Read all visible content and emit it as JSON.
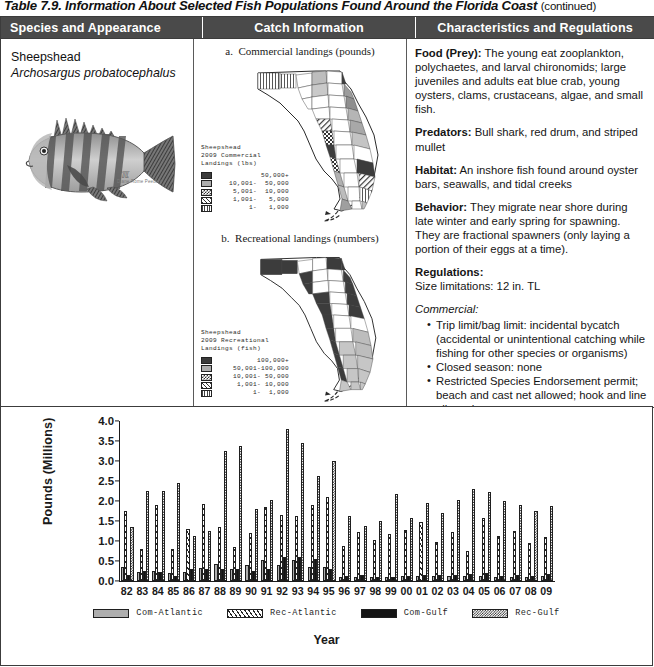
{
  "caption": {
    "text": "Table 7.9. Information About Selected Fish Populations Found Around the Florida Coast",
    "continued": "(continued)"
  },
  "table": {
    "headers": [
      "Species and Appearance",
      "Catch Information",
      "Characteristics and Regulations"
    ],
    "species": {
      "common_name": "Sheepshead",
      "scientific_name": "Archosargus probatocephalus",
      "illustration_credit": "Diane Rome Peebles",
      "illustration_alt": "sheepshead-fish-illustration"
    },
    "catch": {
      "maps": [
        {
          "label": "a.",
          "title": "Commercial landings (pounds)",
          "legend_title_lines": [
            "Sheepshead",
            "2009 Commercial",
            "Landings (lbs)"
          ],
          "legend_entries": [
            {
              "fill": "dark",
              "label": "50,000+"
            },
            {
              "fill": "gray",
              "label": "10,001-  50,000"
            },
            {
              "fill": "check",
              "label": " 5,001-  10,000"
            },
            {
              "fill": "diag",
              "label": " 1,001-   5,000"
            },
            {
              "fill": "vert",
              "label": "     1-   1,000"
            }
          ]
        },
        {
          "label": "b.",
          "title": "Recreational landings (numbers)",
          "legend_title_lines": [
            "Sheepshead",
            "2009 Recreational",
            "Landings (fish)"
          ],
          "legend_entries": [
            {
              "fill": "dark",
              "label": "100,000+"
            },
            {
              "fill": "gray",
              "label": " 50,001-100,000"
            },
            {
              "fill": "check",
              "label": " 10,001- 50,000"
            },
            {
              "fill": "diag",
              "label": "  1,001- 10,000"
            },
            {
              "fill": "vert",
              "label": "      1-  1,000"
            }
          ]
        }
      ]
    },
    "characteristics": {
      "food_label": "Food (Prey):",
      "food_text": " The young eat zooplankton, polychaetes, and larval chironomids; large juveniles and adults eat blue crab, young oysters, clams, crustaceans, algae, and small fish.",
      "predators_label": "Predators:",
      "predators_text": " Bull shark, red drum, and striped mullet",
      "habitat_label": "Habitat:",
      "habitat_text": " An inshore fish found around oyster bars, seawalls, and tidal creeks",
      "behavior_label": "Behavior:",
      "behavior_text": " They migrate near shore during late winter and early spring for spawning. They are fractional spawners (only laying a portion of their eggs at a time).",
      "regulations_label": "Regulations:",
      "size_limitations": "Size limitations: 12 in. TL",
      "commercial_label": "Commercial:",
      "commercial_items": [
        "Trip limit/bag limit: incidental bycatch (accidental or unintentional catching while fishing for other species or organisms)",
        "Closed season: none",
        "Restricted Species Endorsement permit; beach and cast net allowed; hook and line allowed"
      ],
      "recreational_label": "Recreational:",
      "recreational_items": [
        "Trip limit/bag limit: 15 per person per day",
        "Must remain whole until landed ashore; no snatching"
      ]
    }
  },
  "chart_data": {
    "type": "bar",
    "title": "",
    "xlabel": "Year",
    "ylabel": "Pounds  (Millions)",
    "ylim": [
      0.0,
      4.0
    ],
    "yticks": [
      "0.0",
      "0.5",
      "1.0",
      "1.5",
      "2.0",
      "2.5",
      "3.0",
      "3.5",
      "4.0"
    ],
    "grid": false,
    "legend_position": "bottom",
    "categories": [
      "82",
      "83",
      "84",
      "85",
      "86",
      "87",
      "88",
      "89",
      "90",
      "91",
      "92",
      "93",
      "94",
      "95",
      "96",
      "97",
      "98",
      "99",
      "00",
      "01",
      "02",
      "03",
      "04",
      "05",
      "06",
      "07",
      "08",
      "09"
    ],
    "series": [
      {
        "name": "Com-Atlantic",
        "fill": "solid-gray",
        "values": [
          0.35,
          0.22,
          0.24,
          0.19,
          0.22,
          0.33,
          0.42,
          0.31,
          0.39,
          0.52,
          0.41,
          0.52,
          0.34,
          0.36,
          0.1,
          0.11,
          0.11,
          0.1,
          0.13,
          0.12,
          0.12,
          0.13,
          0.12,
          0.12,
          0.11,
          0.11,
          0.1,
          0.12
        ]
      },
      {
        "name": "Rec-Atlantic",
        "fill": "diagonal-hatch",
        "values": [
          1.76,
          0.81,
          1.91,
          0.8,
          1.29,
          1.93,
          1.35,
          0.84,
          1.21,
          1.84,
          1.65,
          1.62,
          1.89,
          2.09,
          0.88,
          1.22,
          1.02,
          1.17,
          1.28,
          1.47,
          0.98,
          1.22,
          0.76,
          1.57,
          1.13,
          1.25,
          0.94,
          1.11
        ]
      },
      {
        "name": "Com-Gulf",
        "fill": "solid-black",
        "values": [
          0.16,
          0.24,
          0.22,
          0.12,
          0.29,
          0.29,
          0.3,
          0.29,
          0.26,
          0.3,
          0.61,
          0.59,
          0.54,
          0.29,
          0.12,
          0.15,
          0.11,
          0.11,
          0.13,
          0.15,
          0.14,
          0.16,
          0.18,
          0.19,
          0.13,
          0.14,
          0.12,
          0.17
        ]
      },
      {
        "name": "Rec-Gulf",
        "fill": "checkered",
        "values": [
          1.36,
          2.25,
          2.25,
          2.44,
          1.13,
          1.26,
          3.26,
          3.38,
          1.8,
          2.02,
          3.8,
          3.44,
          2.63,
          2.99,
          1.62,
          1.38,
          1.5,
          2.18,
          1.57,
          1.94,
          1.71,
          2.02,
          2.29,
          2.23,
          2.0,
          1.91,
          1.76,
          1.87
        ]
      }
    ]
  }
}
